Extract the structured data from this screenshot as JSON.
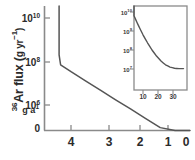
{
  "figure": {
    "background": "#ffffff",
    "line_color": "#555555",
    "axis_color": "#8a8a8a"
  },
  "main": {
    "ylabel_prefix": "36",
    "ylabel_text": "Ar flux (",
    "ylabel_unit": "g yr",
    "ylabel_unit_exp": "−1",
    "ylabel_close": ")",
    "ylabel_sub": "g a",
    "ylabel_sub_exp": "1",
    "ytick_labels": [
      "10",
      "10",
      "10",
      "0"
    ],
    "ytick_exps": [
      "10",
      "8",
      "6",
      ""
    ],
    "xtick_labels": [
      "4",
      "3",
      "2",
      "1",
      "0"
    ]
  },
  "inset": {
    "ytick_labels": [
      "10",
      "10",
      "10",
      "10"
    ],
    "ytick_exps": [
      "10",
      "9",
      "8",
      "7"
    ],
    "xtick_labels": [
      "10",
      "20",
      "30"
    ],
    "unit_label": "Ma"
  },
  "chart_data": {
    "type": "line",
    "title": "",
    "xlabel": "",
    "ylabel": "36Ar flux (g yr-1)",
    "x_reversed": true,
    "y_scale": "log",
    "xlim": [
      4.4,
      0
    ],
    "ylim_exponents": [
      5.2,
      10.6
    ],
    "axis_ytick_values": [
      10000000000.0,
      100000000.0,
      1000000.0,
      0
    ],
    "axis_xtick_values": [
      4,
      3,
      2,
      1,
      0
    ],
    "series": [
      {
        "name": "36Ar flux",
        "comment": "steep initial drop at 4.4 Ga then log-linear decay to present",
        "x": [
          4.4,
          4.4,
          4.35,
          4.0,
          3.5,
          3.0,
          2.5,
          2.0,
          1.5,
          1.0,
          0.5,
          0.0
        ],
        "y_exponent": [
          10.6,
          8.3,
          7.85,
          7.53,
          7.1,
          6.67,
          6.24,
          5.82,
          5.39,
          4.96,
          4.53,
          4.1
        ]
      }
    ],
    "inset": {
      "type": "line",
      "xlabel": "Ma",
      "ylabel": "",
      "y_scale": "log",
      "xlim": [
        0,
        37
      ],
      "ylim_exponents": [
        6.6,
        10.5
      ],
      "axis_ytick_values": [
        10000000000.0,
        1000000000.0,
        100000000.0,
        10000000.0
      ],
      "axis_xtick_values": [
        10,
        20,
        30
      ],
      "series": [
        {
          "name": "36Ar flux (recent)",
          "x": [
            0.5,
            2,
            4,
            6,
            8,
            10,
            13,
            16,
            19,
            22,
            25,
            28,
            31,
            34,
            37
          ],
          "y_exponent": [
            10.5,
            10.15,
            9.8,
            9.45,
            9.12,
            8.8,
            8.38,
            8.0,
            7.68,
            7.42,
            7.22,
            7.1,
            7.04,
            7.02,
            7.02
          ]
        }
      ]
    }
  }
}
